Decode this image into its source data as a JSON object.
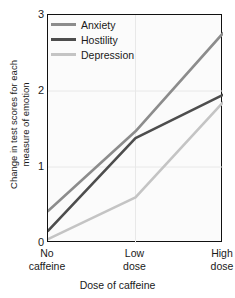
{
  "chart_data": {
    "type": "line",
    "title": "",
    "xlabel": "Dose of caffeine",
    "ylabel": "Change in test scores for each measure of emotion",
    "ylabel_line1": "Change in test scores for each",
    "ylabel_line2": "measure of emotion",
    "categories": [
      "No caffeine",
      "Low dose",
      "High dose"
    ],
    "category_lines": [
      [
        "No",
        "caffeine"
      ],
      [
        "Low",
        "dose"
      ],
      [
        "High",
        "dose"
      ]
    ],
    "ylim": [
      0,
      3
    ],
    "xlim": [
      0,
      2
    ],
    "yticks": [
      0,
      1,
      2,
      3
    ],
    "ytick_labels": [
      "0",
      "1",
      "2",
      "3"
    ],
    "grid": "light horizontal and vertical gridlines",
    "legend_position": "top-left inside plot",
    "series": [
      {
        "name": "Anxiety",
        "color": "#8c8c8c",
        "values": [
          0.42,
          1.47,
          2.76
        ]
      },
      {
        "name": "Hostility",
        "color": "#4d4d4d",
        "values": [
          0.16,
          1.38,
          1.95
        ]
      },
      {
        "name": "Depression",
        "color": "#c4c4c4",
        "values": [
          0.05,
          0.6,
          1.85
        ]
      }
    ]
  },
  "colors": {
    "axis": "#111111",
    "text": "#1a1a1a",
    "plot_background": "#fbfbfb",
    "gridline": "#e8e8e8",
    "anxiety": "#8c8c8c",
    "hostility": "#4d4d4d",
    "depression": "#c4c4c4"
  }
}
